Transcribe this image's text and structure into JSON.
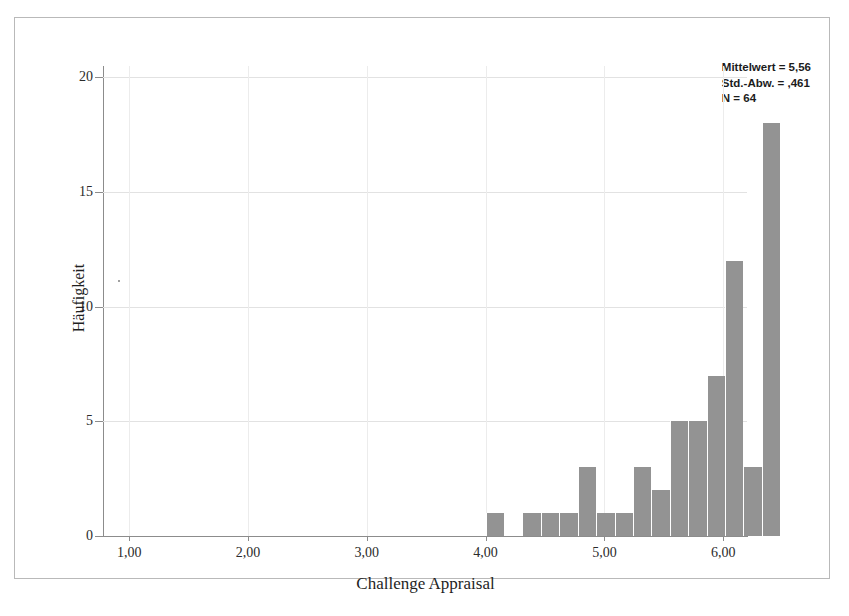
{
  "figure": {
    "x_axis_title": "Challenge Appraisal",
    "y_axis_title": "Häufigkeit"
  },
  "stats": {
    "mean_line": "Mittelwert = 5,56",
    "sd_line": "Std.-Abw. = ,461",
    "n_line": "N = 64"
  },
  "chart_data": {
    "type": "bar",
    "title": "",
    "xlabel": "Challenge Appraisal",
    "ylabel": "Häufigkeit",
    "xlim": [
      0.78,
      6.2
    ],
    "ylim": [
      0,
      20.5
    ],
    "xticks": [
      "1,00",
      "2,00",
      "3,00",
      "4,00",
      "5,00",
      "6,00"
    ],
    "xtick_values": [
      1.0,
      2.0,
      3.0,
      4.0,
      5.0,
      6.0
    ],
    "yticks": [
      "0",
      "5",
      "10",
      "15",
      "20"
    ],
    "ytick_values": [
      0,
      5,
      10,
      15,
      20
    ],
    "grid": true,
    "legend": "none",
    "bar_color": "#939393",
    "bin_width": 0.155,
    "x": [
      4.08,
      4.39,
      4.54,
      4.7,
      4.85,
      5.0,
      5.16,
      5.31,
      5.47,
      5.62,
      5.78,
      5.93
    ],
    "bin_starts": [
      4.0,
      4.31,
      4.47,
      4.62,
      4.78,
      4.93,
      5.08,
      5.24,
      5.39,
      5.55,
      5.7,
      5.85
    ],
    "values": [
      1,
      1,
      1,
      1,
      3,
      1,
      1,
      3,
      2,
      5,
      5,
      7
    ],
    "bars": [
      {
        "x0": 4.0,
        "x1": 4.155,
        "value": 1
      },
      {
        "x0": 4.31,
        "x1": 4.465,
        "value": 1
      },
      {
        "x0": 4.465,
        "x1": 4.62,
        "value": 1
      },
      {
        "x0": 4.62,
        "x1": 4.775,
        "value": 1
      },
      {
        "x0": 4.775,
        "x1": 4.93,
        "value": 3
      },
      {
        "x0": 4.93,
        "x1": 5.085,
        "value": 1
      },
      {
        "x0": 5.085,
        "x1": 5.24,
        "value": 1
      },
      {
        "x0": 5.24,
        "x1": 5.395,
        "value": 3
      },
      {
        "x0": 5.395,
        "x1": 5.55,
        "value": 2
      },
      {
        "x0": 5.55,
        "x1": 5.705,
        "value": 5
      },
      {
        "x0": 5.705,
        "x1": 5.86,
        "value": 5
      },
      {
        "x0": 5.86,
        "x1": 6.015,
        "value": 7
      },
      {
        "x0": 6.015,
        "x1": 6.17,
        "value": 12
      },
      {
        "x0": 6.17,
        "x1": 6.325,
        "value": 3
      },
      {
        "x0": 6.325,
        "x1": 6.48,
        "value": 18
      }
    ],
    "mean": 5.56,
    "std_dev": 0.461,
    "n": 64
  }
}
